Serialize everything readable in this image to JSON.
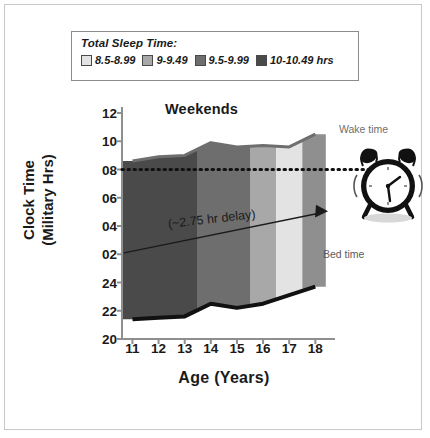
{
  "figure": {
    "border_color": "#c9c9c9",
    "background": "#ffffff"
  },
  "legend": {
    "title": "Total Sleep Time:",
    "items": [
      {
        "label": "8.5-8.99",
        "color": "#e3e3e3"
      },
      {
        "label": "9-9.49",
        "color": "#a8a8a8"
      },
      {
        "label": "9.5-9.99",
        "color": "#6e6e6e"
      },
      {
        "label": "10-10.49 hrs",
        "color": "#4a4a4a"
      }
    ]
  },
  "annotations": {
    "wake_time": "Wake time",
    "bed_time": "Bed time",
    "delay": "(~2.75 hr delay)",
    "clock_icon": "alarm-clock-icon"
  },
  "chart_data": {
    "type": "area",
    "title": "Weekends",
    "xlabel": "Age (Years)",
    "ylabel": "Clock Time\n(Military Hrs)",
    "ylabel_line1": "Clock Time",
    "ylabel_line2": "(Military Hrs)",
    "x": [
      11,
      12,
      13,
      14,
      15,
      16,
      17,
      18
    ],
    "xticks": [
      "11",
      "12",
      "13",
      "14",
      "15",
      "16",
      "17",
      "18"
    ],
    "xlim": [
      10.6,
      18.6
    ],
    "yticks": [
      "12",
      "10",
      "08",
      "06",
      "04",
      "02",
      "24",
      "22",
      "20"
    ],
    "ytick_values": [
      12,
      10,
      8,
      6,
      4,
      2,
      0,
      -2,
      -4
    ],
    "ylim": [
      -4,
      12
    ],
    "grid": false,
    "reference_line": {
      "label": "08:00 reference",
      "value": 8,
      "style": "dotted"
    },
    "series": [
      {
        "name": "Wake time",
        "values": [
          8.6,
          8.9,
          9.0,
          9.9,
          9.6,
          9.7,
          9.6,
          10.5
        ],
        "color": "#6e6e6e"
      },
      {
        "name": "Bed time",
        "values": [
          -2.6,
          -2.5,
          -2.4,
          -1.5,
          -1.8,
          -1.5,
          -0.9,
          -0.3
        ],
        "color": "#111111"
      }
    ],
    "bands": [
      {
        "label": "10-10.49 hrs",
        "x_start": 10.6,
        "x_end": 13.5,
        "color": "#4a4a4a"
      },
      {
        "label": "9.5-9.99",
        "x_start": 13.5,
        "x_end": 15.5,
        "color": "#6e6e6e"
      },
      {
        "label": "9-9.49",
        "x_start": 15.5,
        "x_end": 16.5,
        "color": "#a8a8a8"
      },
      {
        "label": "8.5-8.99",
        "x_start": 16.5,
        "x_end": 17.5,
        "color": "#e3e3e3"
      },
      {
        "label": "9-9.49",
        "x_start": 17.5,
        "x_end": 18.4,
        "color": "#8f8f8f"
      }
    ]
  }
}
